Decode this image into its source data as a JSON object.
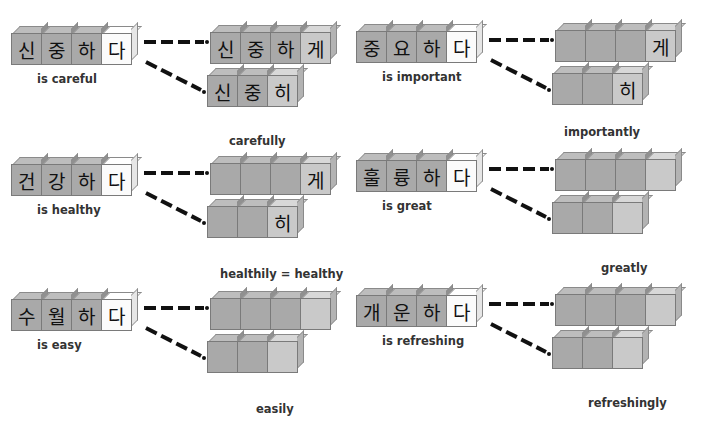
{
  "panels": [
    {
      "base": [
        "신",
        "중",
        "하",
        "다"
      ],
      "base_label": "is careful",
      "ge_form": [
        "신",
        "중",
        "하",
        "게"
      ],
      "hi_form": [
        "신",
        "중",
        "히"
      ],
      "adverb_label": "carefully"
    },
    {
      "base": [
        "중",
        "요",
        "하",
        "다"
      ],
      "base_label": "is important",
      "ge_form": [
        "",
        "",
        "",
        "게"
      ],
      "hi_form": [
        "",
        "",
        "히"
      ],
      "adverb_label": "importantly"
    },
    {
      "base": [
        "건",
        "강",
        "하",
        "다"
      ],
      "base_label": "is healthy",
      "ge_form": [
        "",
        "",
        "",
        "게"
      ],
      "hi_form": [
        "",
        "",
        "히"
      ],
      "adverb_label": "healthily = healthy"
    },
    {
      "base": [
        "훌",
        "륭",
        "하",
        "다"
      ],
      "base_label": "is great",
      "ge_form": [
        "",
        "",
        "",
        ""
      ],
      "hi_form": [
        "",
        "",
        ""
      ],
      "adverb_label": "greatly"
    },
    {
      "base": [
        "수",
        "월",
        "하",
        "다"
      ],
      "base_label": "is easy",
      "ge_form": [
        "",
        "",
        "",
        ""
      ],
      "hi_form": [
        "",
        "",
        ""
      ],
      "adverb_label": "easily"
    },
    {
      "base": [
        "개",
        "운",
        "하",
        "다"
      ],
      "base_label": "is refreshing",
      "ge_form": [
        "",
        "",
        "",
        ""
      ],
      "hi_form": [
        "",
        "",
        ""
      ],
      "adverb_label": "refreshingly"
    }
  ],
  "colors": {
    "block_dark": "#a9a9a9",
    "block_light": "#c9c9c9",
    "block_white": "#fbfbfb",
    "line": "#111111"
  }
}
